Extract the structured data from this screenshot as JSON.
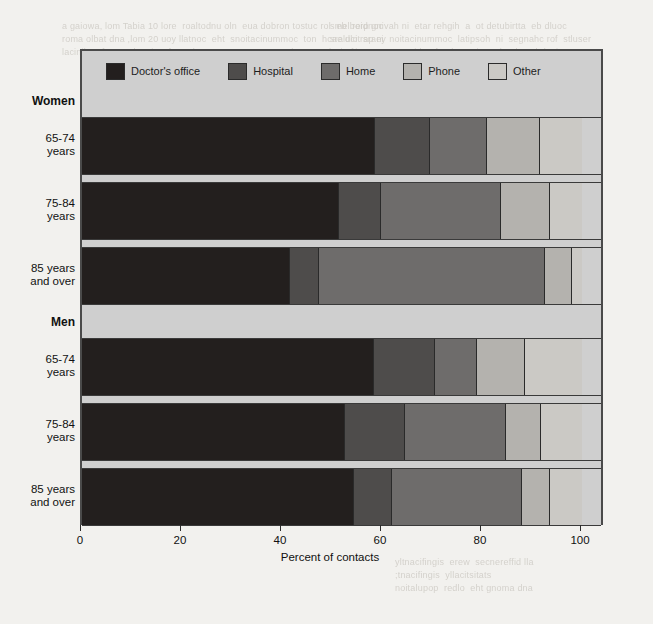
{
  "page": {
    "bleed_top_left": "a gaiowa, lom Tabia 10 lore  roaltodnu oln  eua dobron tostuc rol  eb  reidnoc\nroma olbat dna ,lom 20 uoy llatnoc  eht  snoitacinummoc  ton  hcae dlo  sraey\nlacinilc rof  erac  lanoisseforp  dna  ton  yrassecen  a  dnoces  eht  rof",
    "bleed_top_right": "smelborp gnivah ni  etar rehgih  a  ot detubirtta  eb dluoc\nsralucitrap ni  noitacinummoc  latipsoh  ni  segnahc rof  stluser\nnoitacinummoc  tcerid  a fo  daetsni  enohpelet  ybdeviecer",
    "bleed_bottom_right": "yltnacifingis  erew  secnereffid lla\n;tnacifingis  yllacitsitats\nnoitalupop  redlo  eht gnoma dna"
  },
  "chart_data": {
    "type": "bar",
    "orientation": "horizontal",
    "stacked": true,
    "stacked_percent": true,
    "title": "",
    "xlabel": "Percent of contacts",
    "ylabel": "",
    "xlim": [
      0,
      100
    ],
    "xticks": [
      0,
      20,
      40,
      60,
      80,
      100
    ],
    "xtick_labels": [
      "0",
      "20",
      "40",
      "60",
      "80",
      "100"
    ],
    "grid": false,
    "legend_position": "top",
    "groups": [
      "Women",
      "Men"
    ],
    "categories": [
      "65-74\nyears",
      "75-84\nyears",
      "85 years\nand over",
      "65-74\nyears",
      "75-84\nyears",
      "85 years\nand over"
    ],
    "series": [
      {
        "name": "Doctor's office",
        "color": "#231f1e",
        "values": [
          58.6,
          51.4,
          41.6,
          58.4,
          52.6,
          54.4
        ]
      },
      {
        "name": "Hospital",
        "color": "#4e4c4b",
        "values": [
          11.0,
          8.4,
          5.8,
          12.2,
          12.0,
          7.6
        ]
      },
      {
        "name": "Home",
        "color": "#6e6c6b",
        "values": [
          11.4,
          24.0,
          45.1,
          8.4,
          20.2,
          26.0
        ]
      },
      {
        "name": "Phone",
        "color": "#b4b2ae",
        "values": [
          10.6,
          9.8,
          5.5,
          9.6,
          7.0,
          5.6
        ]
      },
      {
        "name": "Other",
        "color": "#cbc9c5",
        "values": [
          8.4,
          6.4,
          2.0,
          11.4,
          8.2,
          6.4
        ]
      }
    ],
    "rows": [
      {
        "kind": "group",
        "label": "Women"
      },
      {
        "kind": "bar",
        "label": "65-74\nyears",
        "values": [
          58.6,
          11.0,
          11.4,
          10.6,
          8.4
        ]
      },
      {
        "kind": "bar",
        "label": "75-84\nyears",
        "values": [
          51.4,
          8.4,
          24.0,
          9.8,
          6.4
        ]
      },
      {
        "kind": "bar",
        "label": "85 years\nand over",
        "values": [
          41.6,
          5.8,
          45.1,
          5.5,
          2.0
        ]
      },
      {
        "kind": "group",
        "label": "Men"
      },
      {
        "kind": "bar",
        "label": "65-74\nyears",
        "values": [
          58.4,
          12.2,
          8.4,
          9.6,
          11.4
        ]
      },
      {
        "kind": "bar",
        "label": "75-84\nyears",
        "values": [
          52.6,
          12.0,
          20.2,
          7.0,
          8.2
        ]
      },
      {
        "kind": "bar",
        "label": "85 years\nand over",
        "values": [
          54.4,
          7.6,
          26.0,
          5.6,
          6.4
        ]
      }
    ]
  }
}
